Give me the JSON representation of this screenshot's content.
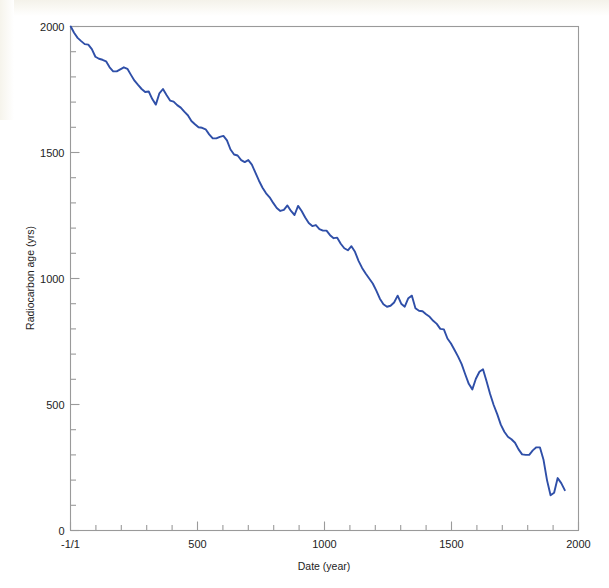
{
  "chart_data": {
    "type": "line",
    "title": "",
    "xlabel": "Date (year)",
    "ylabel": "Radiocarbon age (yrs)",
    "xlim": [
      0,
      2000
    ],
    "ylim": [
      0,
      2000
    ],
    "grid": false,
    "legend": "none",
    "line_color": "#2f4fa8",
    "x_tick_labels": [
      "-1/1",
      "500",
      "1000",
      "1500",
      "2000"
    ],
    "x_tick_values": [
      0,
      500,
      1000,
      1500,
      2000
    ],
    "x_minor_tick_step": 100,
    "y_tick_labels": [
      "0",
      "500",
      "1000",
      "1500",
      "2000"
    ],
    "y_tick_values": [
      0,
      500,
      1000,
      1500,
      2000
    ],
    "y_minor_tick_step": 100,
    "series": [
      {
        "name": "Radiocarbon calibration curve",
        "x": [
          1,
          14,
          28,
          42,
          56,
          70,
          84,
          98,
          112,
          126,
          140,
          154,
          168,
          182,
          196,
          210,
          224,
          238,
          252,
          266,
          280,
          294,
          308,
          322,
          336,
          350,
          364,
          378,
          392,
          406,
          420,
          434,
          448,
          462,
          476,
          490,
          504,
          518,
          532,
          546,
          560,
          574,
          588,
          602,
          616,
          630,
          644,
          658,
          672,
          686,
          700,
          714,
          728,
          742,
          756,
          770,
          784,
          798,
          812,
          826,
          840,
          854,
          868,
          882,
          896,
          910,
          924,
          938,
          952,
          966,
          980,
          994,
          1008,
          1022,
          1036,
          1050,
          1064,
          1078,
          1092,
          1106,
          1120,
          1134,
          1148,
          1162,
          1176,
          1190,
          1204,
          1218,
          1232,
          1246,
          1260,
          1274,
          1288,
          1302,
          1316,
          1330,
          1344,
          1358,
          1372,
          1386,
          1400,
          1414,
          1428,
          1442,
          1456,
          1470,
          1484,
          1498,
          1512,
          1526,
          1540,
          1554,
          1568,
          1582,
          1596,
          1610,
          1624,
          1638,
          1652,
          1666,
          1680,
          1694,
          1708,
          1722,
          1736,
          1750,
          1764,
          1778,
          1792,
          1806,
          1820,
          1834,
          1848,
          1862,
          1876,
          1890,
          1904,
          1918,
          1932,
          1946
        ],
        "y": [
          2000,
          1975,
          1955,
          1942,
          1930,
          1928,
          1910,
          1880,
          1872,
          1868,
          1862,
          1838,
          1822,
          1822,
          1830,
          1838,
          1832,
          1808,
          1785,
          1768,
          1752,
          1740,
          1742,
          1712,
          1690,
          1735,
          1752,
          1728,
          1706,
          1702,
          1688,
          1678,
          1662,
          1648,
          1625,
          1612,
          1600,
          1598,
          1592,
          1572,
          1556,
          1556,
          1562,
          1566,
          1548,
          1512,
          1492,
          1488,
          1470,
          1462,
          1470,
          1452,
          1420,
          1388,
          1360,
          1338,
          1322,
          1300,
          1280,
          1268,
          1272,
          1290,
          1268,
          1252,
          1288,
          1268,
          1242,
          1220,
          1208,
          1212,
          1196,
          1190,
          1190,
          1172,
          1160,
          1162,
          1138,
          1120,
          1112,
          1128,
          1106,
          1070,
          1042,
          1020,
          1000,
          980,
          952,
          920,
          898,
          888,
          892,
          905,
          932,
          900,
          888,
          922,
          932,
          882,
          872,
          870,
          858,
          848,
          832,
          820,
          800,
          798,
          762,
          742,
          716,
          690,
          660,
          620,
          582,
          560,
          602,
          630,
          640,
          592,
          542,
          498,
          462,
          420,
          392,
          372,
          362,
          348,
          322,
          302,
          300,
          300,
          318,
          330,
          330,
          282,
          200,
          140,
          150,
          208,
          188,
          160
        ]
      }
    ],
    "annotations": []
  },
  "axes": {
    "x_axis_title": "Date (year)",
    "y_axis_title": "Radiocarbon age (yrs)",
    "x_ticks": [
      {
        "value": 0,
        "label": "-1/1"
      },
      {
        "value": 500,
        "label": "500"
      },
      {
        "value": 1000,
        "label": "1000"
      },
      {
        "value": 1500,
        "label": "1500"
      },
      {
        "value": 2000,
        "label": "2000"
      }
    ],
    "y_ticks": [
      {
        "value": 0,
        "label": "0"
      },
      {
        "value": 500,
        "label": "500"
      },
      {
        "value": 1000,
        "label": "1000"
      },
      {
        "value": 1500,
        "label": "1500"
      },
      {
        "value": 2000,
        "label": "2000"
      }
    ]
  },
  "style": {
    "line_color": "#2f4fa8",
    "axis_color": "#9a9a9a",
    "text_color": "#232323",
    "background": "#ffffff"
  }
}
